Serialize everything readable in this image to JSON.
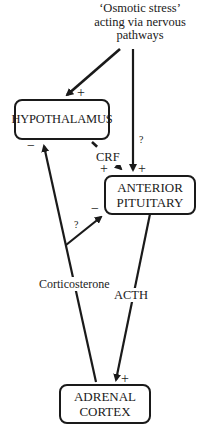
{
  "diagram": {
    "source_label": {
      "line1": "‘Osmotic stress’",
      "line2": "acting via nervous",
      "line3": "pathways"
    },
    "nodes": {
      "hypothalamus": "HYPOTHALAMUS",
      "anterior_pituitary_line1": "ANTERIOR",
      "anterior_pituitary_line2": "PITUITARY",
      "adrenal_cortex_line1": "ADRENAL",
      "adrenal_cortex_line2": "CORTEX"
    },
    "edge_labels": {
      "crf": "CRF",
      "acth": "ACTH",
      "corticosterone": "Corticosterone"
    },
    "signs": {
      "stress_to_hypothalamus": "+",
      "stress_to_pituitary_question": "?",
      "stress_to_pituitary": "+",
      "crf_to_pituitary": "+",
      "cort_to_hypothalamus": "−",
      "cort_to_pituitary_question": "?",
      "cort_to_pituitary": "−",
      "acth_to_adrenal": "+"
    },
    "colors": {
      "stroke": "#1a1a1a",
      "background": "#ffffff"
    }
  }
}
